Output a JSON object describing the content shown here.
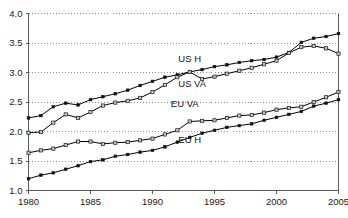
{
  "chart_data": {
    "type": "line",
    "title": "",
    "subtitle": "",
    "xlabel": "",
    "ylabel": "",
    "xlim": [
      1980,
      2005
    ],
    "ylim": [
      1.0,
      4.0
    ],
    "grid": true,
    "legend_position": "inline-annotations",
    "x": [
      1980,
      1981,
      1982,
      1983,
      1984,
      1985,
      1986,
      1987,
      1988,
      1989,
      1990,
      1991,
      1992,
      1993,
      1994,
      1995,
      1996,
      1997,
      1998,
      1999,
      2000,
      2001,
      2002,
      2003,
      2004,
      2005
    ],
    "xticks": [
      1980,
      1985,
      1990,
      1995,
      2000,
      2005
    ],
    "xticklabels": [
      "1980",
      "1985",
      "1990",
      "1995",
      "2000",
      "2005"
    ],
    "yticks": [
      1.0,
      1.5,
      2.0,
      2.5,
      3.0,
      3.5,
      4.0
    ],
    "yticklabels": [
      "1.0",
      "1.5",
      "2.0",
      "2.5",
      "3.0",
      "3.5",
      "4.0"
    ],
    "series": [
      {
        "name": "US H",
        "label": "US H",
        "marker": "filled-square",
        "color": "#111111",
        "label_x": 1993.0,
        "label_y": 3.18,
        "values": [
          2.23,
          2.27,
          2.42,
          2.48,
          2.45,
          2.54,
          2.59,
          2.64,
          2.7,
          2.78,
          2.85,
          2.92,
          2.96,
          3.01,
          3.05,
          3.1,
          3.13,
          3.17,
          3.2,
          3.22,
          3.26,
          3.34,
          3.51,
          3.58,
          3.61,
          3.66
        ]
      },
      {
        "name": "US VA",
        "label": "US VA",
        "marker": "open-square",
        "color": "#c9c9c9",
        "label_x": 1993.2,
        "label_y": 2.76,
        "values": [
          1.98,
          1.99,
          2.15,
          2.29,
          2.23,
          2.33,
          2.44,
          2.49,
          2.52,
          2.57,
          2.67,
          2.79,
          2.92,
          3.01,
          2.89,
          2.93,
          2.98,
          3.03,
          3.08,
          3.14,
          3.2,
          3.33,
          3.43,
          3.45,
          3.41,
          3.32
        ]
      },
      {
        "name": "EU VA",
        "label": "EU VA",
        "marker": "open-square",
        "color": "#c9c9c9",
        "label_x": 1992.6,
        "label_y": 2.42,
        "values": [
          1.64,
          1.68,
          1.71,
          1.77,
          1.83,
          1.83,
          1.79,
          1.81,
          1.82,
          1.85,
          1.88,
          1.95,
          2.02,
          2.17,
          2.18,
          2.19,
          2.23,
          2.27,
          2.28,
          2.32,
          2.37,
          2.4,
          2.42,
          2.5,
          2.58,
          2.67
        ]
      },
      {
        "name": "EU H",
        "label": "EU H",
        "marker": "filled-square",
        "color": "#111111",
        "label_x": 1993.0,
        "label_y": 1.8,
        "values": [
          1.2,
          1.26,
          1.3,
          1.36,
          1.42,
          1.49,
          1.52,
          1.58,
          1.61,
          1.65,
          1.68,
          1.74,
          1.82,
          1.9,
          1.97,
          2.02,
          2.07,
          2.1,
          2.13,
          2.19,
          2.24,
          2.29,
          2.34,
          2.43,
          2.48,
          2.54
        ]
      }
    ]
  }
}
